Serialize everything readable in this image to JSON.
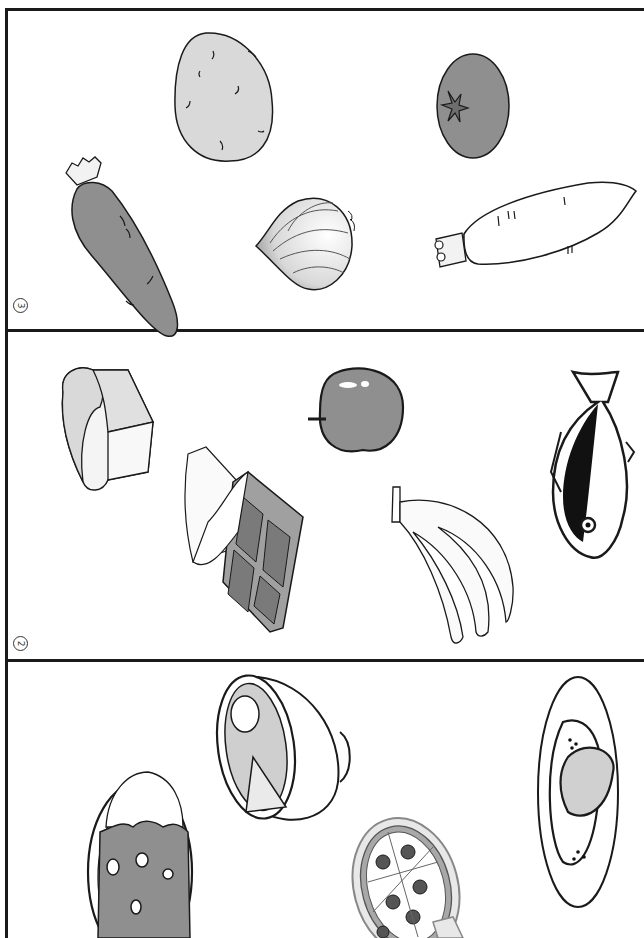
{
  "worksheet": {
    "panels": [
      {
        "number": "3",
        "number_glyph": "③",
        "category": "vegetables",
        "items": [
          {
            "id": "potato",
            "label": "potato"
          },
          {
            "id": "tomato",
            "label": "tomato"
          },
          {
            "id": "carrot",
            "label": "carrot"
          },
          {
            "id": "onion",
            "label": "onion"
          },
          {
            "id": "daikon",
            "label": "daikon radish"
          }
        ]
      },
      {
        "number": "2",
        "number_glyph": "②",
        "category": "foods",
        "items": [
          {
            "id": "bread",
            "label": "bread loaf"
          },
          {
            "id": "apple",
            "label": "apple"
          },
          {
            "id": "fish",
            "label": "fish"
          },
          {
            "id": "chocolate",
            "label": "chocolate bar"
          },
          {
            "id": "banana",
            "label": "bananas"
          }
        ]
      },
      {
        "number": "1",
        "category": "dishes",
        "items": [
          {
            "id": "ramen",
            "label": "ramen bowl"
          },
          {
            "id": "omurice",
            "label": "omelette rice plate"
          },
          {
            "id": "curry",
            "label": "curry rice plate"
          },
          {
            "id": "pizza",
            "label": "pizza"
          }
        ]
      }
    ],
    "colors": {
      "line": "#1a1a1a",
      "light_fill": "#d9d9d9",
      "mid_fill": "#8f8f8f",
      "dark_fill": "#6e6e6e",
      "paper": "#ffffff"
    }
  }
}
